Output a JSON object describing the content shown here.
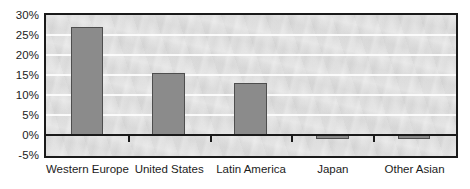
{
  "chart_data": {
    "type": "bar",
    "title": "",
    "subtitle": "",
    "xlabel": "",
    "ylabel": "",
    "categories": [
      "Western Europe",
      "United States",
      "Latin America",
      "Japan",
      "Other Asian"
    ],
    "values": [
      27,
      15.5,
      13,
      -1,
      -1
    ],
    "value_labels": [
      "27%",
      "15.5%",
      "13%",
      "-1%",
      "-1%"
    ],
    "ylim": [
      -5,
      30
    ],
    "ytick_values": [
      30,
      25,
      20,
      15,
      10,
      5,
      0,
      -5
    ],
    "ytick_labels": [
      "30%",
      "25%",
      "20%",
      "15%",
      "10%",
      "5%",
      "0%",
      "-5%"
    ],
    "grid": true,
    "grid_axis": "y",
    "legend": false,
    "legend_position": "none",
    "series": [
      {
        "name": "",
        "values": [
          27,
          15.5,
          13,
          -1,
          -1
        ]
      }
    ],
    "annotations": [],
    "colors": {
      "bar_fill": "#8b8b8b",
      "bar_stroke": "#4e4e4e",
      "plot_background": "#dcdcdc",
      "gridline": "#fdfdfd",
      "axis_line": "#1a1a1a",
      "text": "#1c1c1c",
      "page_background": "#ffffff"
    }
  }
}
